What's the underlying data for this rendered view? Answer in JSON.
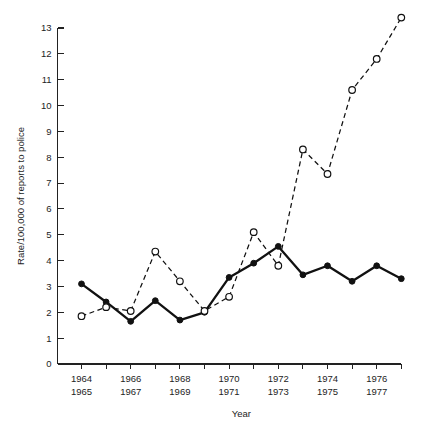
{
  "chart_data": {
    "type": "line",
    "title": "",
    "xlabel": "Year",
    "ylabel": "Rate/100,000 of reports to police",
    "ylim": [
      0,
      13
    ],
    "ytick_labels": [
      "0",
      "1",
      "2",
      "3",
      "4",
      "5",
      "6",
      "7",
      "8",
      "9",
      "10",
      "11",
      "12",
      "13"
    ],
    "ytick_values": [
      0,
      1,
      2,
      3,
      4,
      5,
      6,
      7,
      8,
      9,
      10,
      11,
      12,
      13
    ],
    "x": [
      1964,
      1965,
      1966,
      1967,
      1968,
      1969,
      1970,
      1971,
      1972,
      1973,
      1974,
      1975,
      1976,
      1977
    ],
    "xtick_labels": [
      {
        "top": "1964",
        "bottom": "1965"
      },
      {
        "top": "1966",
        "bottom": "1967"
      },
      {
        "top": "1968",
        "bottom": "1969"
      },
      {
        "top": "1970",
        "bottom": "1971"
      },
      {
        "top": "1972",
        "bottom": "1973"
      },
      {
        "top": "1974",
        "bottom": "1975"
      },
      {
        "top": "1976",
        "bottom": "1977"
      }
    ],
    "grid": false,
    "legend": "none",
    "series": [
      {
        "name": "solid-filled-circle-series",
        "style": "solid",
        "marker": "filled-circle",
        "color": "#111111",
        "values": [
          3.1,
          2.4,
          1.65,
          2.45,
          1.7,
          2.0,
          3.35,
          3.9,
          4.55,
          3.45,
          3.8,
          3.2,
          3.8,
          3.3
        ]
      },
      {
        "name": "dashed-open-circle-series",
        "style": "dashed",
        "marker": "open-circle",
        "color": "#111111",
        "values": [
          1.85,
          2.2,
          2.05,
          4.35,
          3.2,
          2.05,
          2.6,
          5.1,
          3.8,
          8.3,
          7.35,
          10.6,
          11.8,
          13.4
        ]
      }
    ]
  },
  "figure": {
    "background_color": "#ffffff",
    "axis_color": "#222222"
  }
}
